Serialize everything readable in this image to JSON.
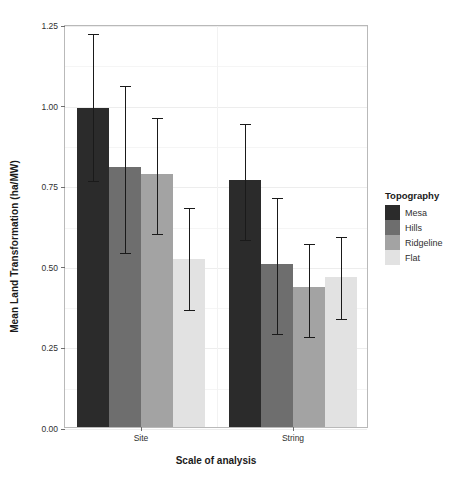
{
  "chart_data": {
    "type": "bar",
    "title": "",
    "xlabel": "Scale of analysis",
    "ylabel": "Mean Land Transformation (ha/MW)",
    "categories": [
      "Site",
      "String"
    ],
    "ylim": [
      0.0,
      1.25
    ],
    "yticks": [
      "0.00",
      "0.25",
      "0.50",
      "0.75",
      "1.00",
      "1.25"
    ],
    "ytick_values": [
      0.0,
      0.25,
      0.5,
      0.75,
      1.0,
      1.25
    ],
    "grid": true,
    "legend_position": "right",
    "legend_title": "Topography",
    "error_bars": "vertical whisker with caps",
    "series": [
      {
        "name": "Mesa",
        "color": "#2b2b2b",
        "values": [
          0.99,
          0.765
        ],
        "err_low": [
          0.77,
          0.585
        ],
        "err_high": [
          1.225,
          0.945
        ]
      },
      {
        "name": "Hills",
        "color": "#6e6e6e",
        "values": [
          0.805,
          0.505
        ],
        "err_low": [
          0.545,
          0.295
        ],
        "err_high": [
          1.065,
          0.715
        ]
      },
      {
        "name": "Ridgeline",
        "color": "#a3a3a3",
        "values": [
          0.785,
          0.435
        ],
        "err_low": [
          0.605,
          0.285
        ],
        "err_high": [
          0.965,
          0.575
        ]
      },
      {
        "name": "Flat",
        "color": "#e2e2e2",
        "values": [
          0.52,
          0.465
        ],
        "err_low": [
          0.37,
          0.34
        ],
        "err_high": [
          0.685,
          0.595
        ]
      }
    ]
  },
  "legend": {
    "title": "Topography",
    "items": [
      {
        "label": "Mesa",
        "color": "#2b2b2b"
      },
      {
        "label": "Hills",
        "color": "#6e6e6e"
      },
      {
        "label": "Ridgeline",
        "color": "#a3a3a3"
      },
      {
        "label": "Flat",
        "color": "#e2e2e2"
      }
    ]
  },
  "axes": {
    "y_title": "Mean Land Transformation (ha/MW)",
    "x_title": "Scale of analysis"
  },
  "colors": {
    "panel_border": "#b9b9b9",
    "grid_major": "#ededed",
    "grid_minor": "#f5f5f5",
    "tick_text": "#303030",
    "error_bar": "#1a1a1a",
    "background": "#ffffff"
  }
}
